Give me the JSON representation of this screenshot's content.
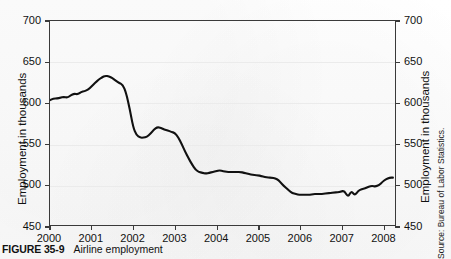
{
  "figure": {
    "number_label": "FIGURE 35-9",
    "caption_text": "Airline employment",
    "source_note": "Source: Bureau of Labor Statistics."
  },
  "axes": {
    "left_title": "Employment in thousands",
    "right_title": "Employment in thousands",
    "y_ticks": [
      "450",
      "500",
      "550",
      "600",
      "650",
      "700"
    ],
    "x_ticks": [
      "2000",
      "2001",
      "2002",
      "2003",
      "2004",
      "2005",
      "2006",
      "2007",
      "2008"
    ]
  },
  "style": {
    "line_color": "#111111",
    "axis_color": "#3a3a3a",
    "grid_color": "#ebebeb",
    "background": "#fdfdfd"
  },
  "chart_data": {
    "type": "line",
    "title": "Airline employment",
    "subtitle": "",
    "xlabel": "",
    "ylabel": "Employment in thousands",
    "xlim": [
      2000.0,
      2008.3
    ],
    "ylim": [
      450,
      700
    ],
    "grid": true,
    "legend": "none",
    "annotations": [],
    "series": [
      {
        "name": "Airline employment",
        "x": [
          2000.0,
          2000.08,
          2000.17,
          2000.25,
          2000.33,
          2000.42,
          2000.5,
          2000.58,
          2000.67,
          2000.75,
          2000.83,
          2000.92,
          2001.0,
          2001.08,
          2001.17,
          2001.25,
          2001.33,
          2001.42,
          2001.5,
          2001.58,
          2001.67,
          2001.75,
          2001.83,
          2001.92,
          2002.0,
          2002.08,
          2002.17,
          2002.25,
          2002.33,
          2002.42,
          2002.5,
          2002.58,
          2002.67,
          2002.75,
          2002.83,
          2002.92,
          2003.0,
          2003.08,
          2003.17,
          2003.25,
          2003.33,
          2003.42,
          2003.5,
          2003.58,
          2003.67,
          2003.75,
          2003.83,
          2003.92,
          2004.0,
          2004.08,
          2004.17,
          2004.25,
          2004.33,
          2004.42,
          2004.5,
          2004.58,
          2004.67,
          2004.75,
          2004.83,
          2004.92,
          2005.0,
          2005.08,
          2005.17,
          2005.25,
          2005.33,
          2005.42,
          2005.5,
          2005.58,
          2005.67,
          2005.75,
          2005.83,
          2005.92,
          2006.0,
          2006.08,
          2006.17,
          2006.25,
          2006.33,
          2006.42,
          2006.5,
          2006.58,
          2006.67,
          2006.75,
          2006.83,
          2006.92,
          2007.0,
          2007.08,
          2007.17,
          2007.25,
          2007.33,
          2007.42,
          2007.5,
          2007.58,
          2007.67,
          2007.75,
          2007.83,
          2007.92,
          2008.0,
          2008.08,
          2008.17,
          2008.25
        ],
        "y": [
          603,
          605,
          605,
          606,
          607,
          606,
          609,
          611,
          610,
          613,
          614,
          616,
          620,
          624,
          628,
          631,
          633,
          632,
          630,
          627,
          624,
          622,
          612,
          592,
          570,
          560,
          557,
          557,
          558,
          562,
          567,
          570,
          569,
          567,
          566,
          564,
          563,
          558,
          549,
          540,
          532,
          524,
          518,
          515,
          514,
          513,
          514,
          515,
          516,
          517,
          516,
          515,
          515,
          515,
          515,
          515,
          514,
          513,
          512,
          511,
          511,
          510,
          509,
          508,
          508,
          507,
          505,
          500,
          496,
          492,
          489,
          488,
          487,
          487,
          487,
          487,
          488,
          488,
          488,
          488,
          489,
          489,
          490,
          490,
          491,
          492,
          484,
          492,
          486,
          492,
          494,
          495,
          497,
          498,
          497,
          499,
          503,
          506,
          508,
          508
        ]
      }
    ]
  }
}
